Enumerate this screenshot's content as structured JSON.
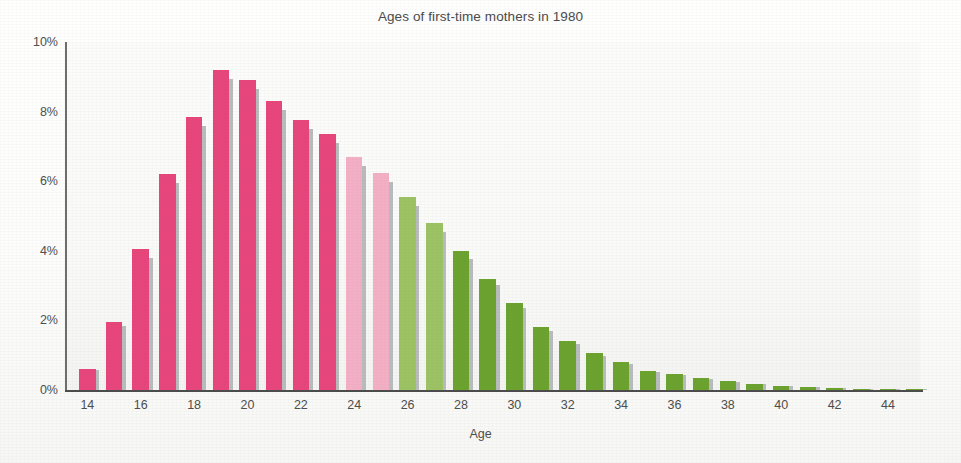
{
  "chart_data": {
    "type": "bar",
    "title": "Ages of first-time mothers in 1980",
    "xlabel": "Age",
    "ylabel": "",
    "grid": false,
    "legend": null,
    "xlim": [
      13.2,
      45.2
    ],
    "ylim": [
      0,
      10
    ],
    "y_tick_labels": [
      "0%",
      "2%",
      "4%",
      "6%",
      "8%",
      "10%"
    ],
    "y_tick_values": [
      0,
      2,
      4,
      6,
      8,
      10
    ],
    "x_tick_labels": [
      "14",
      "16",
      "18",
      "20",
      "22",
      "24",
      "26",
      "28",
      "30",
      "32",
      "34",
      "36",
      "38",
      "40",
      "42",
      "44"
    ],
    "x_tick_values": [
      14,
      16,
      18,
      20,
      22,
      24,
      26,
      28,
      30,
      32,
      34,
      36,
      38,
      40,
      42,
      44
    ],
    "categories": [
      14,
      15,
      16,
      17,
      18,
      19,
      20,
      21,
      22,
      23,
      24,
      25,
      26,
      27,
      28,
      29,
      30,
      31,
      32,
      33,
      34,
      35,
      36,
      37,
      38,
      39,
      40,
      41,
      42,
      43,
      44,
      45
    ],
    "values": [
      0.6,
      1.95,
      4.05,
      6.2,
      7.85,
      9.2,
      8.9,
      8.3,
      7.75,
      7.35,
      6.7,
      6.25,
      5.55,
      4.8,
      4.0,
      3.2,
      2.5,
      1.8,
      1.4,
      1.05,
      0.8,
      0.55,
      0.45,
      0.35,
      0.25,
      0.18,
      0.12,
      0.08,
      0.06,
      0.04,
      0.03,
      0.02
    ],
    "bar_colors": [
      "#e8457c",
      "#e8457c",
      "#e8457c",
      "#e8457c",
      "#e8457c",
      "#e8457c",
      "#e8457c",
      "#e8457c",
      "#e8457c",
      "#e8457c",
      "#f4afc6",
      "#f4afc6",
      "#9cc363",
      "#9cc363",
      "#6ba32e",
      "#6ba32e",
      "#6ba32e",
      "#6ba32e",
      "#6ba32e",
      "#6ba32e",
      "#6ba32e",
      "#6ba32e",
      "#6ba32e",
      "#6ba32e",
      "#6ba32e",
      "#6ba32e",
      "#6ba32e",
      "#6ba32e",
      "#6ba32e",
      "#6ba32e",
      "#6ba32e",
      "#6ba32e"
    ],
    "colors": {
      "deep_pink": "#e8457c",
      "light_pink": "#f4afc6",
      "light_green": "#9cc363",
      "dark_green": "#6ba32e",
      "bar_shadow": "#b9bcbd",
      "axis": "#4b4b4b",
      "text": "#4d4d4d",
      "background": "#ffffff"
    }
  }
}
